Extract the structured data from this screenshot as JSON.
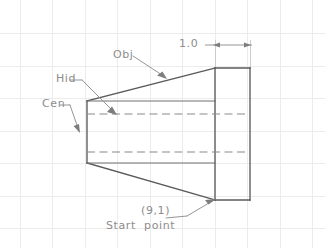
{
  "drawing": {
    "title": "Frustum / tapered block CAD sketch",
    "canvas": {
      "width": 325,
      "height": 248,
      "background": "#ffffff"
    },
    "grid": {
      "visible": true,
      "color": "#ececed",
      "spacing_px": 32.5,
      "x_lines": [
        20,
        52,
        85,
        117,
        150,
        182,
        215,
        247,
        280,
        312
      ],
      "y_lines": [
        33,
        66,
        98,
        131,
        163,
        196,
        228
      ]
    },
    "colors": {
      "object_line": "#5a5a5a",
      "hidden_line": "#8a8a8a",
      "center_line": "#8a8a8a",
      "annotation_text": "#8d8d8d",
      "leader": "#8f8f8f",
      "grid": "#ececed"
    },
    "geometry": {
      "taper_left_x": 87,
      "taper_left_top_y": 101,
      "taper_left_bottom_y": 163,
      "taper_right_x": 215,
      "taper_right_top_y": 68,
      "taper_right_bottom_y": 200,
      "flange_left_x": 215,
      "flange_right_x": 250,
      "flange_top_y": 68,
      "flange_bottom_y": 200,
      "hidden_line_upper_y": 114,
      "hidden_line_lower_y": 152
    }
  },
  "annotations": {
    "obj_label": "Obj",
    "hid_label": "Hid",
    "cen_label": "Cen",
    "start_coord_label": "(9,1)",
    "start_point_label": "Start  point",
    "dimension_value": "1.0"
  },
  "dimension": {
    "value": "1.0",
    "line_y": 45,
    "from_x": 212,
    "to_x": 252,
    "label_x": 180,
    "arrow_style": "filled-triangle"
  },
  "legend": {
    "line_types": [
      {
        "key": "Obj",
        "meaning": "Object (visible) line",
        "style": "solid"
      },
      {
        "key": "Hid",
        "meaning": "Hidden line",
        "style": "dashed"
      },
      {
        "key": "Cen",
        "meaning": "Center line",
        "style": "long-dash"
      }
    ]
  }
}
